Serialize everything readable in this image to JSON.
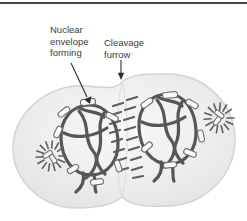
{
  "figure": {
    "labels": {
      "nuclear_envelope": "Nuclear envelope forming",
      "cleavage_furrow": "Cleavage furrow"
    },
    "colors": {
      "top_rule": "#454545",
      "label_text": "#3d3d3d",
      "chromosome": "#565656",
      "cell_outline": "#d2d2d2",
      "cell_fill_center": "#f8f8f8",
      "cell_fill_edge": "#e4e4e4",
      "vesicle_fill": "#fbfbfb"
    }
  }
}
